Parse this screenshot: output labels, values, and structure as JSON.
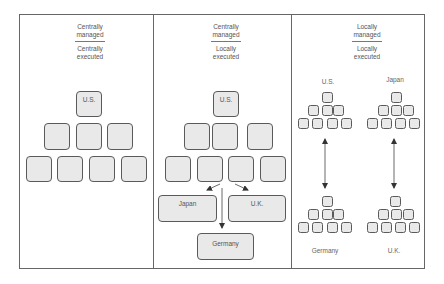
{
  "panels": [
    {
      "heading_top": "Centrally\nmanaged",
      "heading_top_l1": "Centrally",
      "heading_top_l2": "managed",
      "heading_bottom_l1": "Centrally",
      "heading_bottom_l2": "executed",
      "hq_label": "U.S."
    },
    {
      "heading_top_l1": "Centrally",
      "heading_top_l2": "managed",
      "heading_bottom_l1": "Locally",
      "heading_bottom_l2": "executed",
      "hq_label": "U.S.",
      "subsidiaries": [
        "Japan",
        "U.K.",
        "Germany"
      ]
    },
    {
      "heading_top_l1": "Locally",
      "heading_top_l2": "managed",
      "heading_bottom_l1": "Locally",
      "heading_bottom_l2": "executed",
      "pyramid_labels": [
        "U.S.",
        "Japan",
        "Germany",
        "U.K."
      ]
    }
  ],
  "colors": {
    "box_fill": "#e9e9e9",
    "box_border": "#5a5a5a",
    "frame": "#666666",
    "text": "#555555"
  }
}
